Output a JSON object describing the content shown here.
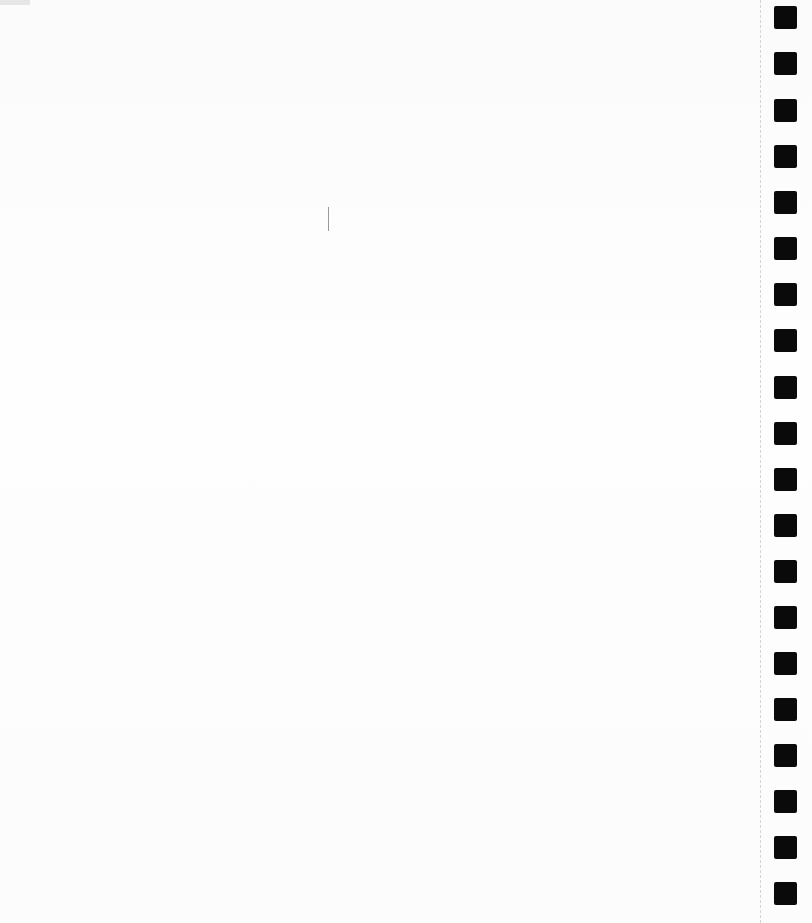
{
  "page": {
    "type": "blank-notebook-page",
    "background_color": "#fdfdfd",
    "hole_color": "#0a0a0a",
    "perforation_color": "#d4d4d4",
    "hole_count": 20,
    "hole_positions_y": [
      6,
      52,
      99,
      145,
      191,
      237,
      283,
      329,
      376,
      422,
      468,
      514,
      560,
      606,
      652,
      698,
      744,
      790,
      836,
      882
    ]
  }
}
